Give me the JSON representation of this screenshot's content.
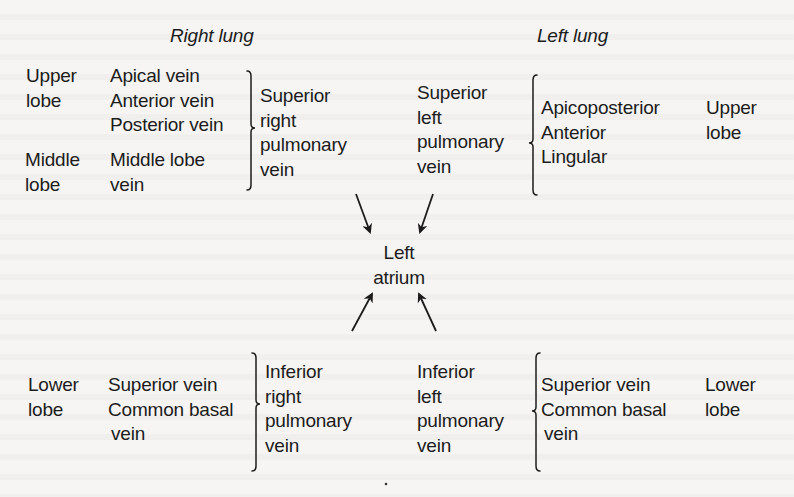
{
  "headings": {
    "right_lung": "Right lung",
    "left_lung": "Left lung"
  },
  "right_lung": {
    "upper_lobe": {
      "lobe_label": [
        "Upper",
        "lobe"
      ],
      "veins": [
        "Apical vein",
        "Anterior vein",
        "Posterior vein"
      ]
    },
    "middle_lobe": {
      "lobe_label": [
        "Middle",
        "lobe"
      ],
      "veins": [
        "Middle lobe",
        "vein"
      ]
    },
    "superior_vessel": [
      "Superior",
      "right",
      "pulmonary",
      "vein"
    ],
    "lower_lobe": {
      "lobe_label": [
        "Lower",
        "lobe"
      ],
      "veins": [
        "Superior vein",
        "Common basal",
        "vein"
      ]
    },
    "inferior_vessel": [
      "Inferior",
      "right",
      "pulmonary",
      "vein"
    ]
  },
  "left_lung": {
    "superior_vessel": [
      "Superior",
      "left",
      "pulmonary",
      "vein"
    ],
    "upper_lobe": {
      "veins": [
        "Apicoposterior",
        "Anterior",
        "Lingular"
      ],
      "lobe_label": [
        "Upper",
        "lobe"
      ]
    },
    "inferior_vessel": [
      "Inferior",
      "left",
      "pulmonary",
      "vein"
    ],
    "lower_lobe": {
      "veins": [
        "Superior vein",
        "Common basal",
        "vein"
      ],
      "lobe_label": [
        "Lower",
        "lobe"
      ]
    }
  },
  "center": {
    "label": [
      "Left",
      "atrium"
    ]
  },
  "colors": {
    "ink": "#1c1c1c",
    "paper": "#f6f5f3"
  }
}
